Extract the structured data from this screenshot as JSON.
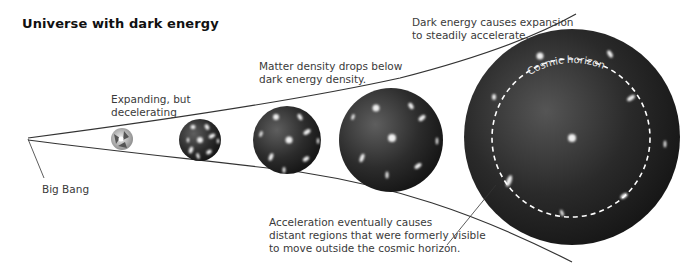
{
  "title": "Universe with dark energy",
  "labels": {
    "big_bang": "Big Bang",
    "expanding": "Expanding, but\ndecelerating",
    "matter_density": "Matter density drops below\ndark energy density.",
    "dark_energy": "Dark energy causes expansion\nto steadily accelerate.",
    "acceleration": "Acceleration eventually causes\ndistant regions that were formerly visible\nto move outside the cosmic horizon.",
    "cosmic_horizon": "Cosmic horizon"
  },
  "colors": {
    "sphere_dark": "#1e1e1e",
    "sphere_light": "#5a5a5a",
    "galaxy": "#f2f2f2",
    "line": "#333333",
    "horizon": "#ffffff"
  },
  "stages": [
    {
      "name": "early-universe",
      "cx": 122,
      "cy": 139,
      "r": 11
    },
    {
      "name": "stage-2",
      "cx": 200,
      "cy": 140,
      "r": 21
    },
    {
      "name": "stage-3",
      "cx": 287,
      "cy": 140,
      "r": 34
    },
    {
      "name": "stage-4",
      "cx": 391,
      "cy": 140,
      "r": 52
    },
    {
      "name": "stage-5",
      "cx": 572,
      "cy": 137,
      "r": 108
    }
  ]
}
